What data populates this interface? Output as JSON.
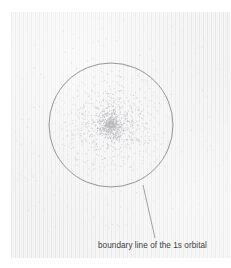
{
  "figure": {
    "type": "diagram",
    "background_color": "#f5f5f6",
    "page_color": "#ffffff"
  },
  "annotations": [
    {
      "id": "boundary-label",
      "text": "boundary line of the 1s orbital",
      "color": "#3c3c3c",
      "font_size_px": 8.2,
      "x": 98,
      "y": 241,
      "leader_line": {
        "from_x": 143,
        "from_y": 185,
        "to_x": 155,
        "to_y": 238,
        "color": "#8c8c8c",
        "width_px": 0.8
      }
    }
  ],
  "boundary_circle": {
    "label": "boundary line of the 1s orbital",
    "center_x": 111,
    "center_y": 125,
    "radius": 62,
    "stroke_color": "#8a8a8a",
    "stroke_width_px": 0.9,
    "fill": "none"
  },
  "nucleus": {
    "center_x": 111,
    "center_y": 125,
    "marker_color": "#c9c9cc"
  },
  "electron_cloud": {
    "description": "Radially decreasing density of dots representing electron probability density of the 1s orbital",
    "dot_color": "#b9b9bd",
    "dot_radius_px": 0.55,
    "inner_dot_count": 1150,
    "outer_dot_count": 120,
    "inner_max_radius": 62,
    "outer_min_radius": 64,
    "outer_max_radius": 132,
    "density_exponent": 2.2,
    "random_seed": 20240517
  },
  "chart_data": {
    "type": "scatter",
    "xlabel": "",
    "ylabel": "",
    "annotations": [
      "boundary line of the 1s orbital"
    ],
    "radial_density_profile": {
      "radius_fraction": [
        0.0,
        0.1,
        0.2,
        0.3,
        0.4,
        0.5,
        0.6,
        0.7,
        0.8,
        0.9,
        1.0,
        1.3,
        1.6,
        2.0
      ],
      "relative_dot_density": [
        1.0,
        0.92,
        0.78,
        0.62,
        0.47,
        0.35,
        0.25,
        0.17,
        0.11,
        0.07,
        0.045,
        0.018,
        0.008,
        0.003
      ]
    }
  }
}
